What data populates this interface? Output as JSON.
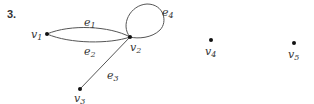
{
  "problem_number": "3.",
  "graph": {
    "vertices": [
      {
        "id": "v1",
        "name": "v",
        "sub": "1",
        "x": 47,
        "y": 34
      },
      {
        "id": "v2",
        "name": "v",
        "sub": "2",
        "x": 130,
        "y": 37
      },
      {
        "id": "v3",
        "name": "v",
        "sub": "3",
        "x": 80,
        "y": 89
      },
      {
        "id": "v4",
        "name": "v",
        "sub": "4",
        "x": 211,
        "y": 40
      },
      {
        "id": "v5",
        "name": "v",
        "sub": "5",
        "x": 294,
        "y": 43
      }
    ],
    "edges": [
      {
        "id": "e1",
        "name": "e",
        "sub": "1",
        "from": "v1",
        "to": "v2"
      },
      {
        "id": "e2",
        "name": "e",
        "sub": "2",
        "from": "v1",
        "to": "v2"
      },
      {
        "id": "e3",
        "name": "e",
        "sub": "3",
        "from": "v2",
        "to": "v3"
      },
      {
        "id": "e4",
        "name": "e",
        "sub": "4",
        "from": "v2",
        "to": "v2",
        "type": "loop"
      }
    ]
  },
  "colors": {
    "edge": "#555555",
    "vertex": "#111111",
    "text": "#333333"
  }
}
